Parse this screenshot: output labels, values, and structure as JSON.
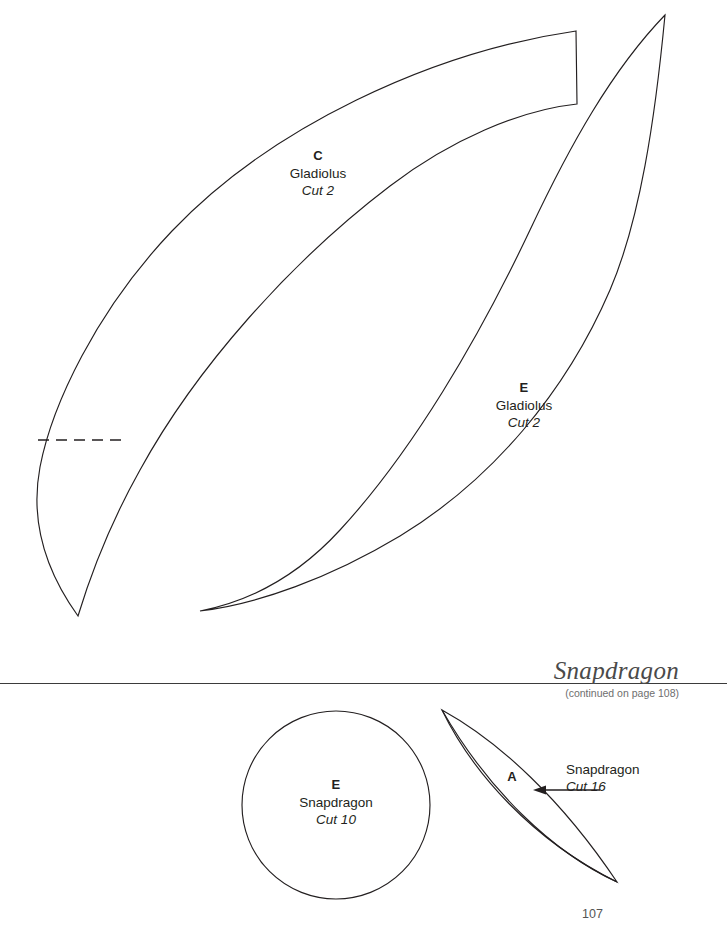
{
  "page": {
    "folio": "107",
    "background_color": "#ffffff",
    "ink_color": "#231f20"
  },
  "section_header": {
    "title": "Snapdragon",
    "continued_note": "(continued on page 108)",
    "rule_color": "#3b3b3b"
  },
  "patterns": [
    {
      "id": "c-gladiolus",
      "letter": "C",
      "flower": "Gladiolus",
      "cut": "Cut 2",
      "shape": "long-curved-petal",
      "has_dashed_fold_line": true
    },
    {
      "id": "e-gladiolus",
      "letter": "E",
      "flower": "Gladiolus",
      "cut": "Cut 2",
      "shape": "long-curved-petal",
      "has_dashed_fold_line": false
    },
    {
      "id": "e-snapdragon",
      "letter": "E",
      "flower": "Snapdragon",
      "cut": "Cut 10",
      "shape": "circle",
      "has_dashed_fold_line": false
    },
    {
      "id": "a-snapdragon",
      "letter": "A",
      "flower": "Snapdragon",
      "cut": "Cut 16",
      "shape": "pointed-leaf",
      "has_dashed_fold_line": false,
      "callout_arrow": "arrow-left-icon"
    }
  ]
}
